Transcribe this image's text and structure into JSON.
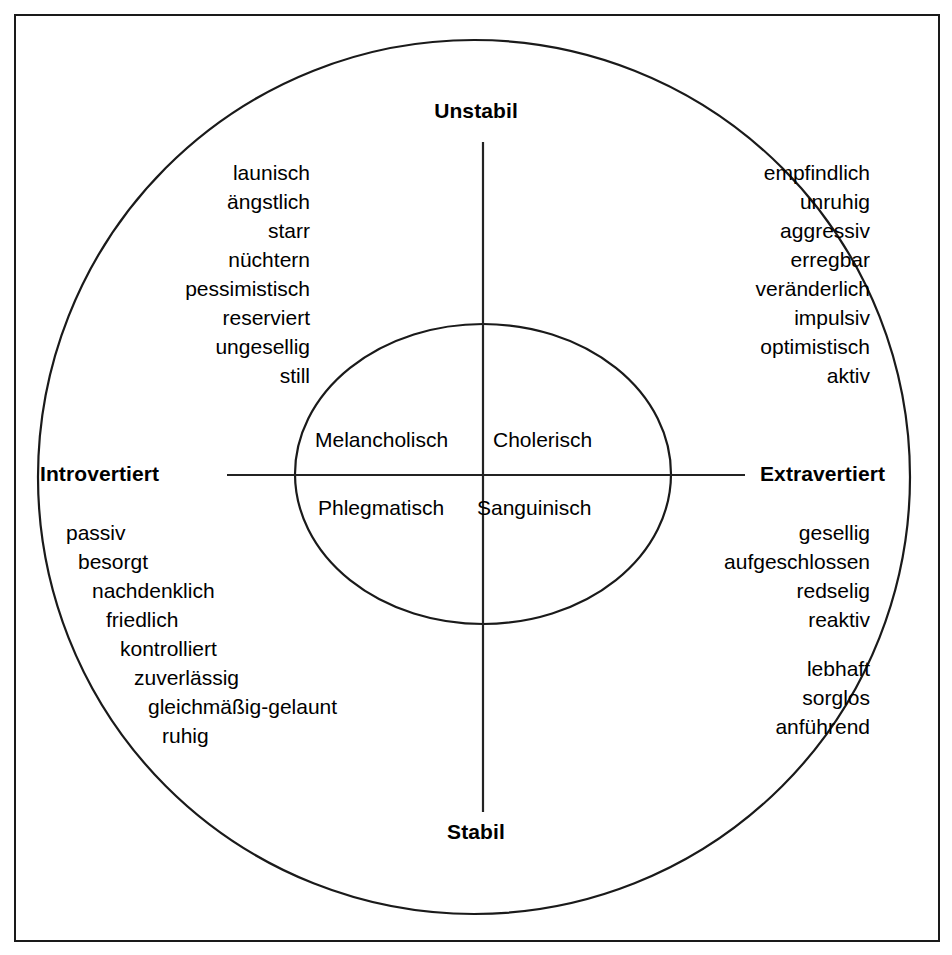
{
  "figure": {
    "title_unstable": "Unstabil",
    "title_stable": "Stabil",
    "title_introvert": "Introvertiert",
    "title_extravert": "Extravertiert"
  },
  "temperaments": {
    "top_left": "Melancholisch",
    "top_right": "Cholerisch",
    "bottom_left": "Phlegmatisch",
    "bottom_right": "Sanguinisch"
  },
  "quadrants": {
    "melancholic": {
      "name": "Melancholisch",
      "traits": [
        "launisch",
        "ängstlich",
        "starr",
        "nüchtern",
        "pessimistisch",
        "reserviert",
        "ungesellig",
        "still"
      ]
    },
    "choleric": {
      "name": "Cholerisch",
      "traits": [
        "empfindlich",
        "unruhig",
        "aggressiv",
        "erregbar",
        "veränderlich",
        "impulsiv",
        "optimistisch",
        "aktiv"
      ]
    },
    "phlegmatic": {
      "name": "Phlegmatisch",
      "traits": [
        "passiv",
        "besorgt",
        "nachdenklich",
        "friedlich",
        "kontrolliert",
        "zuverlässig",
        "gleichmäßig-gelaunt",
        "ruhig"
      ]
    },
    "sanguine": {
      "name": "Sanguinisch",
      "traits_upper": [
        "gesellig",
        "aufgeschlossen",
        "redselig",
        "reaktiv"
      ],
      "traits_lower": [
        "lebhaft",
        "sorglos",
        "anführend"
      ]
    }
  },
  "colors": {
    "stroke": "#1a1a1a",
    "line": "#232323",
    "text": "#000000",
    "background": "#ffffff"
  },
  "geometry": {
    "outer_ellipse": {
      "cx": 474,
      "cy": 477,
      "rx": 436,
      "ry": 437
    },
    "inner_ellipse": {
      "cx": 483,
      "cy": 474,
      "rx": 188,
      "ry": 150
    },
    "vertical_axis": {
      "x": 483,
      "y1": 142,
      "y2": 812
    },
    "horizontal_axis": {
      "y": 475,
      "x1": 227,
      "x2": 745
    }
  }
}
